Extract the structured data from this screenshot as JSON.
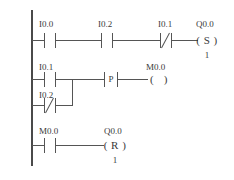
{
  "diagram": {
    "type": "ladder-logic",
    "title": "",
    "rails": {
      "left_label": ""
    },
    "rungs": [
      {
        "id": "rung-1",
        "elements": [
          {
            "kind": "contact-no",
            "label": "I0.0"
          },
          {
            "kind": "contact-no",
            "label": "I0.2"
          },
          {
            "kind": "contact-nc",
            "label": "I0.1"
          },
          {
            "kind": "coil-set",
            "label": "Q0.0",
            "symbol": "( S )",
            "operand": "1"
          }
        ]
      },
      {
        "id": "rung-2",
        "elements": [
          {
            "kind": "contact-no",
            "label": "I0.1"
          },
          {
            "kind": "contact-nc",
            "label": "I0.2",
            "branch": true
          },
          {
            "kind": "edge-positive",
            "label": "P"
          },
          {
            "kind": "coil-output",
            "label": "M0.0",
            "symbol": "(   )"
          }
        ]
      },
      {
        "id": "rung-3",
        "elements": [
          {
            "kind": "contact-no",
            "label": "M0.0"
          },
          {
            "kind": "coil-reset",
            "label": "Q0.0",
            "symbol": "( R )",
            "operand": "1"
          }
        ]
      }
    ],
    "labels": {
      "r1_c1": "I0.0",
      "r1_c2": "I0.2",
      "r1_c3": "I0.1",
      "r1_coil": "Q0.0",
      "r1_coil_symbol": "( S )",
      "r1_coil_operand": "1",
      "r2_c1": "I0.1",
      "r2_c2": "I0.2",
      "r2_p": "P",
      "r2_coil": "M0.0",
      "r2_coil_symbol": "(   )",
      "r3_c1": "M0.0",
      "r3_coil": "Q0.0",
      "r3_coil_symbol": "( R )",
      "r3_coil_operand": "1"
    },
    "colors": {
      "line": "#555555",
      "rail": "#4a4a4a",
      "text": "#3a3a3a",
      "background": "#ffffff"
    }
  }
}
